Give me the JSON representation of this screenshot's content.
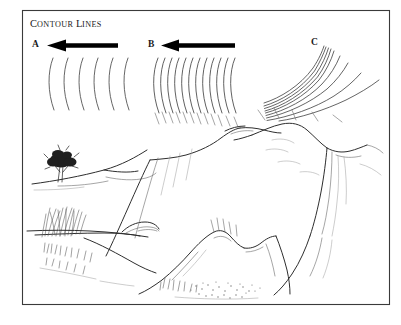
{
  "figure": {
    "title_lead": "C",
    "title_rest_1": "ONTOUR",
    "title_lead_2": "L",
    "title_rest_2": "INES",
    "title_full": "Contour lines",
    "background_color": "#ffffff",
    "frame_color": "#3a3a3a",
    "ink_color": "#2e2e2e"
  },
  "panels": [
    {
      "id": "a",
      "label": "A",
      "arrow": "left-arrow",
      "arrow_present": true,
      "contour_count": 6,
      "spacing": "wide",
      "meaning": "gentle slope"
    },
    {
      "id": "b",
      "label": "B",
      "arrow": "left-arrow",
      "arrow_present": true,
      "contour_count": 12,
      "spacing": "close",
      "meaning": "steep slope"
    },
    {
      "id": "c",
      "label": "C",
      "arrow": "none",
      "arrow_present": false,
      "contour_count": 9,
      "spacing": "converging",
      "meaning": "cliff"
    }
  ],
  "sketches": [
    {
      "id": "tree-slope",
      "name": "gentle-slope-with-tree",
      "features": [
        "tree",
        "gentle hillside",
        "horizon ridge"
      ]
    },
    {
      "id": "grass-slope",
      "name": "grassy-slope",
      "features": [
        "grass tufts",
        "ridge line",
        "descending slope"
      ]
    },
    {
      "id": "ridge",
      "name": "central-steep-ridge",
      "features": [
        "steep escarpment",
        "ridge crest",
        "shaded face"
      ]
    },
    {
      "id": "peak",
      "name": "mountain-peak-with-cliff",
      "features": [
        "summit",
        "vertical cliff face",
        "scree"
      ]
    },
    {
      "id": "rocky-ground",
      "name": "rocky-stippled-terrain",
      "features": [
        "rock outcrop",
        "stippled ground",
        "grass clumps"
      ]
    }
  ]
}
